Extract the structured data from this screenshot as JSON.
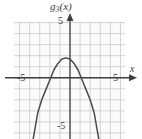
{
  "chart_data": {
    "type": "line",
    "title_base": "g",
    "title_sub": "3",
    "title_tail": "(x)",
    "xlabel": "x",
    "ylabel": "",
    "xlim": [
      -5.55,
      5.45
    ],
    "ylim": [
      -5.55,
      5.05
    ],
    "grid": true,
    "grid_step": 1,
    "legend": false,
    "axis_ticks": {
      "x": [
        "-5",
        "5"
      ],
      "y": [
        "5",
        "-5"
      ]
    },
    "x_tick_values": [
      -5,
      5
    ],
    "y_tick_values": [
      5,
      -5
    ],
    "series": [
      {
        "name": "g_3(x)",
        "shape": "parabola-downward",
        "vertex": [
          -0.4,
          1.8
        ],
        "x_intercepts": [
          -2.5,
          1.7
        ],
        "leading_coefficient": -0.72,
        "x": [
          -4.05,
          -3.6,
          -3.2,
          -2.8,
          -2.4,
          -2.0,
          -1.6,
          -1.2,
          -0.8,
          -0.4,
          0.0,
          0.4,
          0.8,
          1.2,
          1.6,
          2.0,
          2.4,
          2.8,
          3.25
        ],
        "y": [
          -7.6,
          -5.3,
          -3.2,
          -2.0,
          -1.1,
          -0.2,
          0.7,
          1.3,
          1.7,
          1.8,
          1.7,
          1.3,
          0.7,
          -0.2,
          -1.1,
          -2.0,
          -3.2,
          -5.3,
          -7.6
        ]
      }
    ],
    "colors": {
      "curve": "#4a4a4a",
      "axis": "#3f3f3f",
      "grid": "#c9c9c9",
      "background": "#fbfbfb",
      "text": "#3a3a3a"
    }
  }
}
